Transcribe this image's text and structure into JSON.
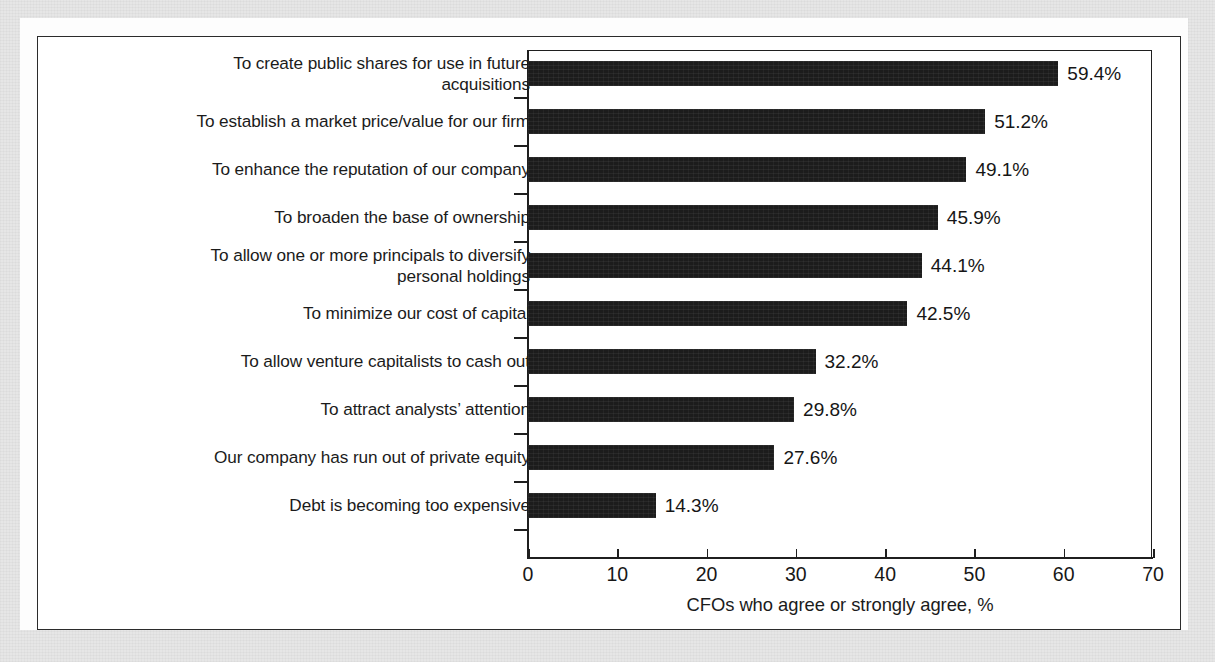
{
  "chart_data": {
    "type": "bar",
    "orientation": "horizontal",
    "title": "",
    "xlabel": "CFOs who agree or strongly agree, %",
    "ylabel": "",
    "xlim": [
      0,
      70
    ],
    "xticks": [
      0,
      10,
      20,
      30,
      40,
      50,
      60,
      70
    ],
    "grid": false,
    "legend": null,
    "bar_color": "#1c1c1c",
    "value_suffix": "%",
    "categories": [
      "To create public shares for use in future\nacquisitions",
      "To establish a market price/value for our firm",
      "To enhance the reputation of our company",
      "To broaden the base of ownership",
      "To allow one or more principals to diversify\npersonal holdings",
      "To minimize our cost of capital",
      "To allow venture capitalists to cash out",
      "To attract analysts’ attention",
      "Our company has run out of private equity",
      "Debt is becoming too expensive"
    ],
    "values": [
      59.4,
      51.2,
      49.1,
      45.9,
      44.1,
      42.5,
      32.2,
      29.8,
      27.6,
      14.3
    ],
    "value_labels": [
      "59.4%",
      "51.2%",
      "49.1%",
      "45.9%",
      "44.1%",
      "42.5%",
      "32.2%",
      "29.8%",
      "27.6%",
      "14.3%"
    ]
  }
}
